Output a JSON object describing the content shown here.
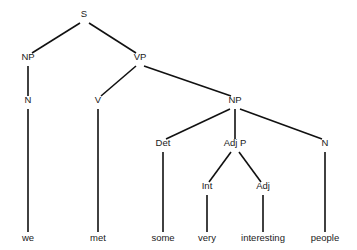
{
  "figure": {
    "type": "syntax-tree",
    "sentence": "we met some very interesting people",
    "background_color": "#ffffff",
    "line_color": "#111111",
    "text_color": "#1a1a1a"
  },
  "nodes": [
    {
      "id": "S",
      "label": "S",
      "x": 84,
      "y": 17
    },
    {
      "id": "NP1",
      "label": "NP",
      "x": 28,
      "y": 60
    },
    {
      "id": "VP",
      "label": "VP",
      "x": 140,
      "y": 60
    },
    {
      "id": "N1",
      "label": "N",
      "x": 28,
      "y": 103
    },
    {
      "id": "V",
      "label": "V",
      "x": 98,
      "y": 103
    },
    {
      "id": "NP2",
      "label": "NP",
      "x": 235,
      "y": 103
    },
    {
      "id": "Det",
      "label": "Det",
      "x": 163,
      "y": 146
    },
    {
      "id": "AdjP",
      "label": "Adj P",
      "x": 235,
      "y": 146
    },
    {
      "id": "N2",
      "label": "N",
      "x": 325,
      "y": 146
    },
    {
      "id": "Int",
      "label": "Int",
      "x": 207,
      "y": 189
    },
    {
      "id": "Adj",
      "label": "Adj",
      "x": 263,
      "y": 189
    }
  ],
  "terminals": [
    {
      "id": "w-we",
      "label": "we",
      "x": 28,
      "y": 241,
      "parent": "N1"
    },
    {
      "id": "w-met",
      "label": "met",
      "x": 98,
      "y": 241,
      "parent": "V"
    },
    {
      "id": "w-some",
      "label": "some",
      "x": 163,
      "y": 241,
      "parent": "Det"
    },
    {
      "id": "w-very",
      "label": "very",
      "x": 207,
      "y": 241,
      "parent": "Int"
    },
    {
      "id": "w-interesting",
      "label": "interesting",
      "x": 263,
      "y": 241,
      "parent": "Adj"
    },
    {
      "id": "w-people",
      "label": "people",
      "x": 325,
      "y": 241,
      "parent": "N2"
    }
  ],
  "edges": [
    {
      "from": "S",
      "to": "NP1",
      "x1": 80,
      "y1": 23,
      "x2": 32,
      "y2": 53
    },
    {
      "from": "S",
      "to": "VP",
      "x1": 89,
      "y1": 23,
      "x2": 136,
      "y2": 53
    },
    {
      "from": "NP1",
      "to": "N1",
      "x1": 28,
      "y1": 66,
      "x2": 28,
      "y2": 96
    },
    {
      "from": "VP",
      "to": "V",
      "x1": 136,
      "y1": 66,
      "x2": 101,
      "y2": 96
    },
    {
      "from": "VP",
      "to": "NP2",
      "x1": 144,
      "y1": 66,
      "x2": 231,
      "y2": 96
    },
    {
      "from": "NP2",
      "to": "Det",
      "x1": 230,
      "y1": 109,
      "x2": 166,
      "y2": 139
    },
    {
      "from": "NP2",
      "to": "AdjP",
      "x1": 235,
      "y1": 109,
      "x2": 235,
      "y2": 139
    },
    {
      "from": "NP2",
      "to": "N2",
      "x1": 240,
      "y1": 109,
      "x2": 322,
      "y2": 139
    },
    {
      "from": "AdjP",
      "to": "Int",
      "x1": 231,
      "y1": 152,
      "x2": 209,
      "y2": 182
    },
    {
      "from": "AdjP",
      "to": "Adj",
      "x1": 239,
      "y1": 152,
      "x2": 261,
      "y2": 182
    },
    {
      "from": "Det",
      "to": "w-some",
      "x1": 163,
      "y1": 152,
      "x2": 163,
      "y2": 232
    },
    {
      "from": "N1",
      "to": "w-we",
      "x1": 28,
      "y1": 109,
      "x2": 28,
      "y2": 232
    },
    {
      "from": "V",
      "to": "w-met",
      "x1": 98,
      "y1": 109,
      "x2": 98,
      "y2": 232
    },
    {
      "from": "Int",
      "to": "w-very",
      "x1": 207,
      "y1": 195,
      "x2": 207,
      "y2": 232
    },
    {
      "from": "Adj",
      "to": "w-interesting",
      "x1": 263,
      "y1": 195,
      "x2": 263,
      "y2": 232
    },
    {
      "from": "N2",
      "to": "w-people",
      "x1": 325,
      "y1": 152,
      "x2": 325,
      "y2": 232
    }
  ]
}
